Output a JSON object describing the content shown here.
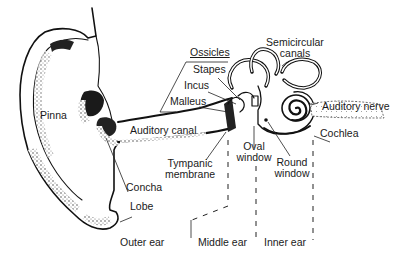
{
  "diagram": {
    "labels": {
      "pinna": "Pinna",
      "auditory_canal": "Auditory canal",
      "concha": "Concha",
      "lobe": "Lobe",
      "ossicles": "Ossicles",
      "stapes": "Stapes",
      "incus": "Incus",
      "malleus": "Malleus",
      "tympanic_membrane_1": "Tympanic",
      "tympanic_membrane_2": "membrane",
      "semicircular_canals_1": "Semicircular",
      "semicircular_canals_2": "canals",
      "auditory_nerve": "Auditory nerve",
      "cochlea": "Cochlea",
      "oval_window_1": "Oval",
      "oval_window_2": "window",
      "round_window_1": "Round",
      "round_window_2": "window"
    },
    "regions": {
      "outer": "Outer ear",
      "middle": "Middle ear",
      "inner": "Inner ear"
    },
    "colors": {
      "ink": "#111111",
      "background": "#ffffff",
      "shading": "#555555"
    }
  }
}
